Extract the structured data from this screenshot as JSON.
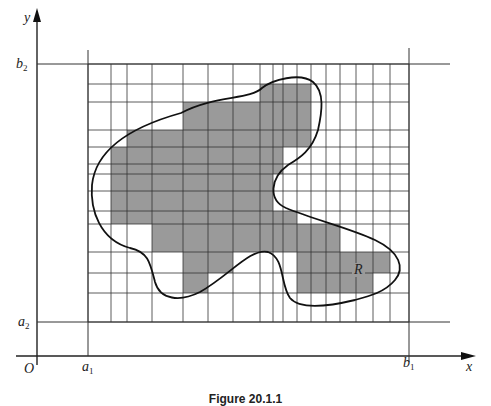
{
  "figure": {
    "caption": "Figure 20.1.1",
    "labels": {
      "y_axis": "y",
      "x_axis": "x",
      "origin": "O",
      "b2": {
        "base": "b",
        "sub": "2"
      },
      "a2": {
        "base": "a",
        "sub": "2"
      },
      "a1": {
        "base": "a",
        "sub": "1"
      },
      "b1": {
        "base": "b",
        "sub": "1"
      },
      "region": "R"
    },
    "colors": {
      "line": "#333333",
      "shade": "#9a9a9a",
      "curve": "#111111"
    },
    "grid": {
      "x_lines": [
        88,
        111,
        127,
        152,
        183,
        208,
        233,
        260,
        273,
        283,
        297,
        311,
        326,
        340,
        356,
        373,
        390,
        409
      ],
      "y_lines": [
        64,
        84,
        102,
        130,
        147,
        164,
        174,
        191,
        211,
        224,
        252,
        273,
        293,
        322
      ]
    },
    "shaded_cells": [
      {
        "row": [
          84,
          102
        ],
        "x": [
          260,
          311
        ]
      },
      {
        "row": [
          102,
          130
        ],
        "x": [
          183,
          311
        ]
      },
      {
        "row": [
          130,
          147
        ],
        "x": [
          127,
          311
        ]
      },
      {
        "row": [
          147,
          174
        ],
        "x": [
          111,
          283
        ]
      },
      {
        "row": [
          174,
          211
        ],
        "x": [
          111,
          273
        ]
      },
      {
        "row": [
          211,
          224
        ],
        "x": [
          111,
          297
        ]
      },
      {
        "row": [
          224,
          252
        ],
        "x": [
          152,
          340
        ]
      },
      {
        "row": [
          252,
          273
        ],
        "x": [
          183,
          233
        ]
      },
      {
        "row": [
          252,
          273
        ],
        "x": [
          297,
          390
        ]
      },
      {
        "row": [
          273,
          293
        ],
        "x": [
          183,
          208
        ]
      },
      {
        "row": [
          273,
          293
        ],
        "x": [
          297,
          373
        ]
      }
    ]
  }
}
